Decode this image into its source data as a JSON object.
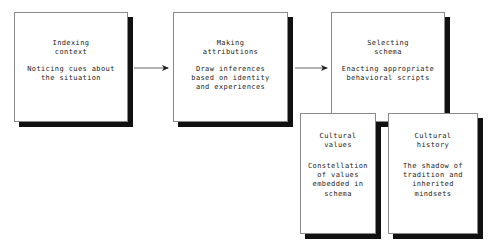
{
  "diagram": {
    "type": "flowchart",
    "orientation": "left-to-right",
    "canvas": {
      "width": 492,
      "height": 246,
      "background": "#ffffff"
    },
    "style": {
      "box_border_color": "#8a8a8a",
      "box_fill_color": "#ffffff",
      "shadow_color": "#111111",
      "text_color": "#222222",
      "arrow_color": "#555555"
    },
    "nodes": [
      {
        "id": "indexing-context",
        "title": "Indexing\ncontext",
        "body": "Noticing cues about\nthe situation",
        "x": 14,
        "y": 12,
        "w": 114,
        "h": 110,
        "title_top": 26,
        "body_top": 52
      },
      {
        "id": "making-attributions",
        "title": "Making\nattributions",
        "body": "Draw inferences\nbased on identity\nand experiences",
        "x": 173,
        "y": 12,
        "w": 115,
        "h": 110,
        "title_top": 26,
        "body_top": 52
      },
      {
        "id": "selecting-schema",
        "title": "Selecting\nschema",
        "body": "Enacting appropriate\nbehavioral scripts",
        "x": 331,
        "y": 12,
        "w": 114,
        "h": 110,
        "title_top": 26,
        "body_top": 52
      },
      {
        "id": "cultural-values",
        "title": "Cultural\nvalues",
        "body": "Constellation\nof values\nembedded in\nschema",
        "x": 300,
        "y": 113,
        "w": 76,
        "h": 121,
        "title_top": 18,
        "body_top": 48
      },
      {
        "id": "cultural-history",
        "title": "Cultural\nhistory",
        "body": "The shadow of\ntradition and\ninherited\nmindsets",
        "x": 388,
        "y": 113,
        "w": 90,
        "h": 121,
        "title_top": 18,
        "body_top": 48
      }
    ],
    "arrows": [
      {
        "id": "arrow-indexing-to-attributions",
        "from": "indexing-context",
        "to": "making-attributions",
        "x1": 134,
        "y1": 68,
        "x2": 171,
        "y2": 68
      },
      {
        "id": "arrow-attributions-to-schema",
        "from": "making-attributions",
        "to": "selecting-schema",
        "x1": 295,
        "y1": 68,
        "x2": 330,
        "y2": 68
      }
    ]
  }
}
